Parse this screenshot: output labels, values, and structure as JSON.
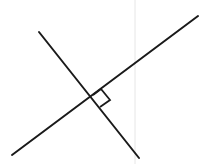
{
  "diagram": {
    "type": "perpendicular-lines",
    "colors": {
      "line": "#1a1a1a",
      "guide": "#e6e6e6",
      "background": "#ffffff"
    },
    "line_a": {
      "x1": 12,
      "y1": 155,
      "x2": 198,
      "y2": 16
    },
    "line_b": {
      "x1": 39,
      "y1": 32,
      "x2": 139,
      "y2": 158
    },
    "right_angle_marker": {
      "points": "92,95 101,89 110,100 100,107"
    },
    "guide_line": {
      "x": 135,
      "y1": 0,
      "y2": 164
    }
  }
}
